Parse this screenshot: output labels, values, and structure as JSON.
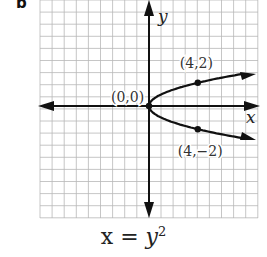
{
  "panel": {
    "label": "b"
  },
  "equation": {
    "lhs": "x",
    "eq": " = ",
    "base": "y",
    "exp": "2"
  },
  "colors": {
    "grid": "#b8b8b8",
    "axis": "#111111",
    "curve": "#111111"
  },
  "chart_data": {
    "type": "line",
    "xlabel": "x",
    "ylabel": "y",
    "grid": true,
    "xlim": [
      -9,
      9
    ],
    "ylim": [
      -9,
      9
    ],
    "series": [
      {
        "name": "x = y^2",
        "x": [
          9,
          6.25,
          4,
          2.25,
          1,
          0.25,
          0,
          0.25,
          1,
          2.25,
          4,
          6.25,
          9
        ],
        "y": [
          -3,
          -2.5,
          -2,
          -1.5,
          -1,
          -0.5,
          0,
          0.5,
          1,
          1.5,
          2,
          2.5,
          3
        ]
      }
    ],
    "points": [
      {
        "label": "(0,0)",
        "x": 0,
        "y": 0
      },
      {
        "label": "(4,2)",
        "x": 4,
        "y": 2
      },
      {
        "label": "(4,−2)",
        "x": 4,
        "y": -2
      }
    ]
  }
}
